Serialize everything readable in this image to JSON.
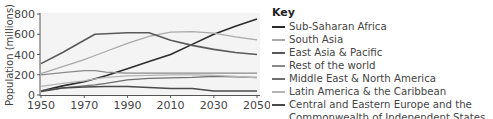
{
  "chart_data": {
    "type": "line",
    "title": "",
    "xlabel": "",
    "ylabel": "Population (millions)",
    "ylim": [
      0,
      800
    ],
    "xlim": [
      1950,
      2050
    ],
    "x_ticks": [
      "1950",
      "1970",
      "1990",
      "2010",
      "2030",
      "2050"
    ],
    "y_ticks": [
      "0",
      "200",
      "400",
      "600",
      "800"
    ],
    "grid": false,
    "legend_position": "right",
    "legend_title": "Key",
    "x": [
      1950,
      1960,
      1970,
      1975,
      1980,
      1990,
      2000,
      2010,
      2020,
      2030,
      2040,
      2050
    ],
    "series": [
      {
        "name": "Sub-Saharan Africa",
        "color": "#2b2b2b",
        "width": 1.6,
        "values": [
          40,
          90,
          130,
          160,
          190,
          260,
          330,
          400,
          500,
          600,
          680,
          750
        ]
      },
      {
        "name": "South Asia",
        "color": "#a9a9a9",
        "width": 1.3,
        "values": [
          210,
          280,
          350,
          390,
          430,
          510,
          580,
          620,
          625,
          610,
          575,
          545
        ]
      },
      {
        "name": "East Asia & Pacific",
        "color": "#5a5a5a",
        "width": 1.6,
        "values": [
          310,
          420,
          540,
          600,
          605,
          615,
          615,
          540,
          490,
          450,
          420,
          400
        ]
      },
      {
        "name": "Rest of the world",
        "color": "#8a8a8a",
        "width": 1.3,
        "values": [
          200,
          220,
          240,
          240,
          225,
          215,
          215,
          215,
          215,
          215,
          215,
          215
        ]
      },
      {
        "name": "Middle East & North America",
        "color": "#6e6e6e",
        "width": 1.3,
        "values": [
          40,
          70,
          90,
          100,
          115,
          150,
          165,
          170,
          175,
          185,
          180,
          175
        ]
      },
      {
        "name": "Latin America & the Caribbean",
        "color": "#b5b5b5",
        "width": 1.2,
        "values": [
          85,
          115,
          140,
          160,
          175,
          190,
          195,
          200,
          200,
          195,
          185,
          170
        ]
      },
      {
        "name": "Central and Eastern Europe and the Commonwealth of Independent States",
        "color": "#4a4a4a",
        "width": 1.5,
        "values": [
          35,
          70,
          80,
          82,
          85,
          85,
          75,
          65,
          65,
          40,
          40,
          40
        ]
      }
    ]
  },
  "legend": {
    "title": "Key",
    "items": [
      "Sub-Saharan Africa",
      "South Asia",
      "East Asia & Pacific",
      "Rest of the world",
      "Middle East & North America",
      "Latin America & the Caribbean",
      "Central and Eastern Europe and the Commonwealth of Independent States"
    ]
  },
  "axes": {
    "ylabel": "Population (millions)"
  }
}
